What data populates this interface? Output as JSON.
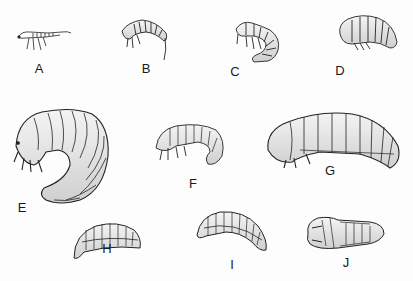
{
  "figure": {
    "panels": [
      {
        "id": "A",
        "label": "A",
        "form": "campodeiform larva",
        "label_pos": [
          39,
          69
        ]
      },
      {
        "id": "B",
        "label": "B",
        "form": "carabiform larva",
        "label_pos": [
          146,
          69
        ]
      },
      {
        "id": "C",
        "label": "C",
        "form": "curved larva",
        "label_pos": [
          235,
          72
        ]
      },
      {
        "id": "D",
        "label": "D",
        "form": "grub",
        "label_pos": [
          340,
          71
        ]
      },
      {
        "id": "E",
        "label": "E",
        "form": "scarabaeiform larva",
        "label_pos": [
          22,
          208
        ]
      },
      {
        "id": "F",
        "label": "F",
        "form": "curved grub",
        "label_pos": [
          193,
          184
        ]
      },
      {
        "id": "G",
        "label": "G",
        "form": "large grub",
        "label_pos": [
          330,
          171
        ]
      },
      {
        "id": "H",
        "label": "H",
        "form": "legless larva",
        "label_pos": [
          107,
          249
        ]
      },
      {
        "id": "I",
        "label": "I",
        "form": "legless larva",
        "label_pos": [
          232,
          265
        ]
      },
      {
        "id": "J",
        "label": "J",
        "form": "pupa",
        "label_pos": [
          346,
          263
        ]
      }
    ]
  },
  "colors": {
    "background": "#fdfdfd",
    "ink": "#1a1a1a",
    "shade": "#d8d8d8"
  }
}
